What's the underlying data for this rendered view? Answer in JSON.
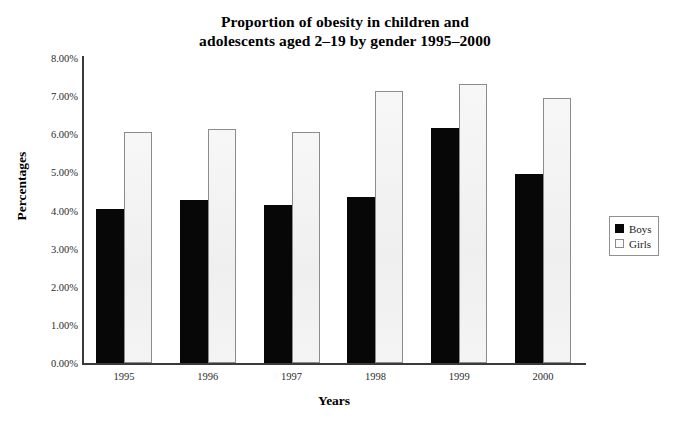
{
  "chart_data": {
    "type": "bar",
    "title": "Proportion of obesity in children and adolescents aged 2–19 by gender 1995–2000",
    "title_lines": [
      "Proportion of obesity in children and",
      "adolescents aged 2–19 by gender 1995–2000"
    ],
    "xlabel": "Years",
    "ylabel": "Percentages",
    "categories": [
      "1995",
      "1996",
      "1997",
      "1998",
      "1999",
      "2000"
    ],
    "series": [
      {
        "name": "Boys",
        "color": "#070707",
        "values": [
          4.04,
          4.27,
          4.14,
          4.35,
          6.16,
          4.95
        ]
      },
      {
        "name": "Girls",
        "color": "#f4f4f4",
        "values": [
          6.05,
          6.14,
          6.05,
          7.14,
          7.33,
          6.94
        ]
      }
    ],
    "ylim": [
      0,
      8
    ],
    "ytick_values": [
      8,
      7,
      6,
      5,
      4,
      3,
      2,
      1,
      0
    ],
    "ytick_labels": [
      "8.00%",
      "7.00%",
      "6.00%",
      "5.00%",
      "4.00%",
      "3.00%",
      "2.00%",
      "1.00%",
      "0.00%"
    ],
    "grid": false,
    "legend_position": "right",
    "legend": [
      {
        "label": "Boys",
        "swatch": "filled-black-square"
      },
      {
        "label": "Girls",
        "swatch": "open-white-square"
      }
    ]
  }
}
